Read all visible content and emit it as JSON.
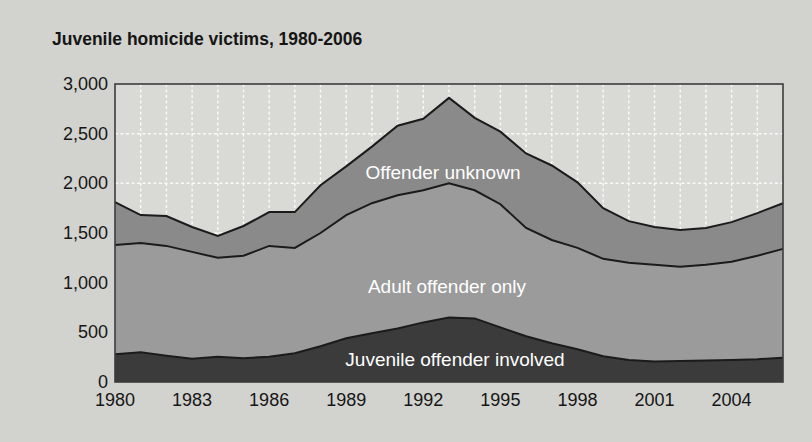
{
  "page": {
    "background": "#d2d2ce"
  },
  "chart": {
    "title": "Juvenile homicide victims, 1980-2006",
    "plot_bg": "#d9d9d5",
    "grid_color": "#fafaf7",
    "border_color": "#3c3c3c",
    "edge_line_color": "#1b1b1b"
  },
  "chart_data": {
    "type": "area",
    "stacked": true,
    "title": "Juvenile homicide victims, 1980-2006",
    "xlabel": "",
    "ylabel": "",
    "x": [
      1980,
      1981,
      1982,
      1983,
      1984,
      1985,
      1986,
      1987,
      1988,
      1989,
      1990,
      1991,
      1992,
      1993,
      1994,
      1995,
      1996,
      1997,
      1998,
      1999,
      2000,
      2001,
      2002,
      2003,
      2004,
      2005,
      2006
    ],
    "series": [
      {
        "name": "Juvenile offender involved",
        "color": "#3b3b3b",
        "values": [
          280,
          300,
          265,
          235,
          255,
          240,
          255,
          290,
          360,
          440,
          490,
          540,
          600,
          650,
          640,
          550,
          460,
          390,
          330,
          260,
          220,
          205,
          210,
          215,
          220,
          230,
          245
        ]
      },
      {
        "name": "Adult offender only",
        "color": "#9b9b9b",
        "values": [
          1100,
          1100,
          1105,
          1075,
          995,
          1030,
          1115,
          1060,
          1140,
          1240,
          1310,
          1340,
          1330,
          1350,
          1290,
          1240,
          1090,
          1040,
          1020,
          980,
          980,
          975,
          950,
          965,
          990,
          1040,
          1095
        ]
      },
      {
        "name": "Offender unknown",
        "color": "#8a8a8a",
        "values": [
          430,
          280,
          300,
          250,
          220,
          300,
          340,
          360,
          480,
          490,
          570,
          700,
          720,
          860,
          730,
          730,
          750,
          750,
          660,
          510,
          420,
          380,
          370,
          370,
          400,
          430,
          460
        ]
      }
    ],
    "stacked_totals": [
      1810,
      1680,
      1670,
      1560,
      1470,
      1570,
      1710,
      1710,
      1980,
      2170,
      2370,
      2580,
      2650,
      2860,
      2660,
      2520,
      2300,
      2180,
      2010,
      1750,
      1620,
      1560,
      1530,
      1550,
      1610,
      1700,
      1800
    ],
    "ylim": [
      0,
      3000
    ],
    "y_ticks": [
      {
        "value": 3000,
        "label": "3,000"
      },
      {
        "value": 2500,
        "label": "2,500"
      },
      {
        "value": 2000,
        "label": "2,000"
      },
      {
        "value": 1500,
        "label": "1,500"
      },
      {
        "value": 1000,
        "label": "1,000"
      },
      {
        "value": 500,
        "label": "500"
      },
      {
        "value": 0,
        "label": "0"
      }
    ],
    "x_ticks": [
      1980,
      1983,
      1986,
      1989,
      1992,
      1995,
      1998,
      2001,
      2004
    ],
    "grid": true,
    "grid_style": "white-dashed, vertical line every year, horizontal every 500",
    "legend": "labels drawn inside bands"
  },
  "band_labels": {
    "unknown": "Offender unknown",
    "adult": "Adult offender only",
    "juvenile": "Juvenile offender involved"
  }
}
